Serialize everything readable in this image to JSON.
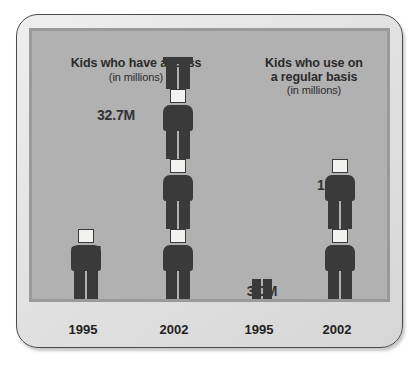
{
  "chart_data": {
    "type": "bar",
    "xlabel": "",
    "ylabel": "",
    "unit_note": "(in millions)",
    "groups": [
      {
        "name": "Kids who have access",
        "title_line1": "Kids who have access",
        "subtitle": "(in millions)",
        "categories": [
          "1995",
          "2002"
        ],
        "values": [
          9.5,
          32.7
        ],
        "value_labels": [
          "9.5M",
          "32.7M"
        ]
      },
      {
        "name": "Kids who use on a regular basis",
        "title_line1": "Kids who use on",
        "title_line2": "a regular basis",
        "subtitle": "(in millions)",
        "categories": [
          "1995",
          "2002"
        ],
        "values": [
          3.0,
          18.9
        ],
        "value_labels": [
          "3.0M",
          "18.9M"
        ]
      }
    ],
    "pictogram": {
      "icon": "person-icon",
      "unit_per_figure": 9.5,
      "figures_access_1995": 1,
      "figures_access_2002": 3.5,
      "figures_use_1995": 0.3,
      "figures_use_2002": 2
    },
    "colors": {
      "figure": "#3a3a3a",
      "head": "#f2f2f0",
      "field": "#b1b1b1",
      "bezel": "#e2e2e2",
      "text": "#2b2b2b"
    }
  },
  "titles": {
    "access": {
      "line1": "Kids who have access",
      "sub": "(in millions)"
    },
    "use": {
      "line1": "Kids who use on",
      "line2": "a regular basis",
      "sub": "(in millions)"
    }
  },
  "values": {
    "access_1995": "9.5M",
    "access_2002": "32.7M",
    "use_1995": "3.0M",
    "use_2002": "18.9M"
  },
  "axis": {
    "access_1995": "1995",
    "access_2002": "2002",
    "use_1995": "1995",
    "use_2002": "2002"
  }
}
